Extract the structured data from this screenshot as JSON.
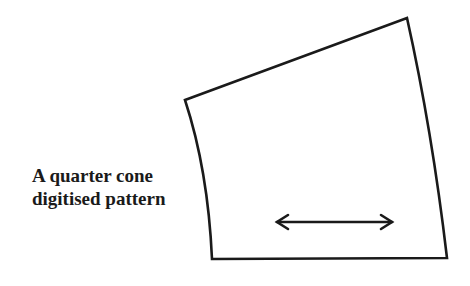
{
  "diagram": {
    "label_lines": [
      "A quarter cone",
      "digitised pattern"
    ],
    "shape": "quarter-cone-pattern-piece",
    "grainline": "double-headed-arrow",
    "stroke_color": "#1a1a1a"
  }
}
